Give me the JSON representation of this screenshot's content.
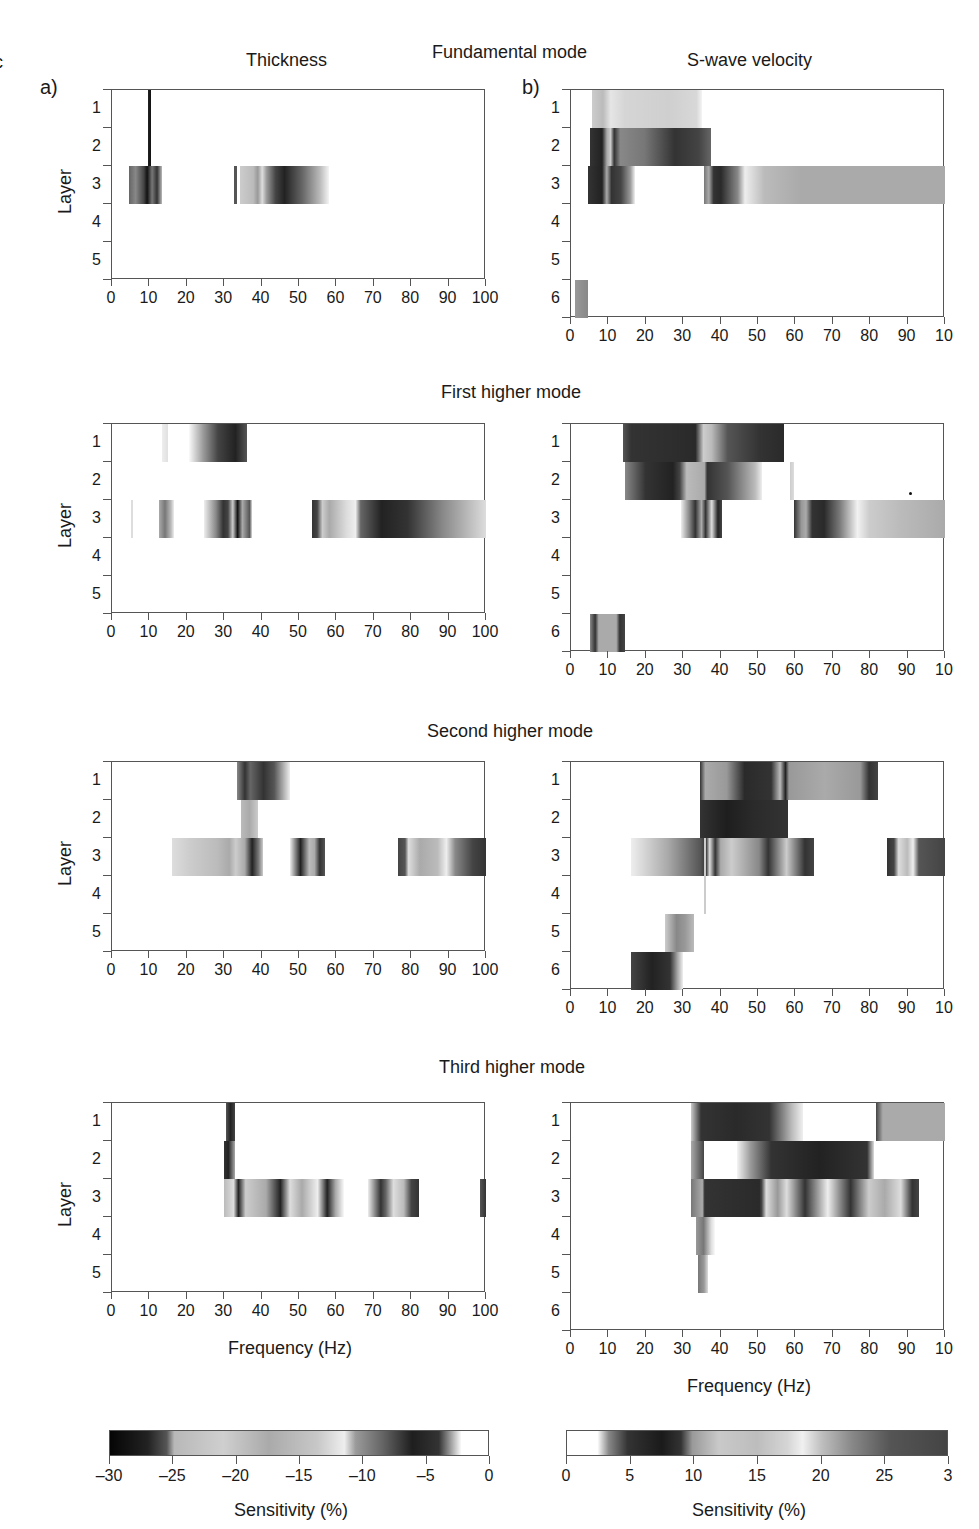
{
  "figure": {
    "edge_fragment": "c",
    "panel_labels": {
      "a": "a)",
      "b": "b)"
    },
    "column_titles": {
      "thickness": "Thickness",
      "vs": "S-wave velocity"
    },
    "y_axis_label": "Layer",
    "x_axis_label": "Frequency (Hz)",
    "colorbars": {
      "left": {
        "ticks": [
          "–30",
          "–25",
          "–20",
          "–15",
          "–10",
          "–5",
          "0"
        ],
        "title": "Sensitivity (%)",
        "gradient": "linear-gradient(to right,#050505 0%,#222 10%,#555 15%,#b8b8b8 17%,#cfcfcf 30%,#aaa 42%,#c8c8c8 55%,#eee 62%,#9a9a9a 65%,#666 72%,#1e1e1e 80%,#333 87%,#bbb 91%,#fff 93%,#fff 100%)"
      },
      "right": {
        "ticks": [
          "0",
          "5",
          "10",
          "15",
          "20",
          "25",
          "3"
        ],
        "title": "Sensitivity (%)",
        "gradient": "linear-gradient(to right,#fff 0%,#fff 8%,#888 11%,#333 16%,#1a1a1a 25%,#333 30%,#9a9a9a 33%,#c9c9c9 40%,#bdbdbd 50%,#d5d5d5 58%,#f0f0f0 62%,#bfbfbf 67%,#888 75%,#555 85%,#444 100%)"
      }
    }
  },
  "chart_data": [
    {
      "type": "heatmap",
      "title": "Fundamental mode",
      "panel": "Thickness",
      "xlabel": "",
      "ylabel": "Layer",
      "xlim": [
        0,
        100
      ],
      "layers": 5,
      "x_ticks": [
        "0",
        "10",
        "20",
        "30",
        "40",
        "50",
        "60",
        "70",
        "80",
        "90",
        "100"
      ],
      "y_ticks": [
        "1",
        "2",
        "3",
        "4",
        "5"
      ],
      "bands": [
        {
          "layer_from": 1,
          "layer_to": 3,
          "x0": 9.5,
          "x1": 10.5,
          "gradient": "linear-gradient(to right,#222,#111)"
        },
        {
          "layer_from": 3,
          "layer_to": 3,
          "x0": 4.5,
          "x1": 13.5,
          "gradient": "linear-gradient(to right,#666,#888 20%,#444 45%,#111 55%,#777 70%,#333 85%,#bbb)"
        },
        {
          "layer_from": 3,
          "layer_to": 3,
          "x0": 32.5,
          "x1": 33.3,
          "gradient": "linear-gradient(to right,#555,#555)"
        },
        {
          "layer_from": 3,
          "layer_to": 3,
          "x0": 34.2,
          "x1": 58,
          "gradient": "linear-gradient(to right,#ccc,#bbb 15%,#999 20%,#ddd 25%,#999 30%,#444 40%,#222 50%,#666 70%,#bbb 90%,#f4f4f4)"
        }
      ],
      "sensitivity_range": [
        -30,
        0
      ]
    },
    {
      "type": "heatmap",
      "title": "Fundamental mode",
      "panel": "S-wave velocity",
      "xlabel": "",
      "ylabel": "",
      "xlim": [
        0,
        100
      ],
      "layers": 6,
      "x_ticks": [
        "0",
        "10",
        "20",
        "30",
        "40",
        "50",
        "60",
        "70",
        "80",
        "90",
        "10"
      ],
      "y_ticks": [
        "1",
        "2",
        "3",
        "4",
        "5",
        "6"
      ],
      "bands": [
        {
          "layer_from": 1,
          "layer_to": 1,
          "x0": 5.5,
          "x1": 35,
          "gradient": "linear-gradient(to right,#ccc,#bbb 10%,#e5e5e5 17%,#d5d5d5 30%,#cfcfcf 70%,#d8d8d8 95%,#f4f4f4)"
        },
        {
          "layer_from": 2,
          "layer_to": 2,
          "x0": 5,
          "x1": 37.5,
          "gradient": "linear-gradient(to right,#333,#222 10%,#aaa 14%,#ccc 17%,#333 20%,#888 25%,#777 45%,#333 70%,#444 90%,#666)"
        },
        {
          "layer_from": 3,
          "layer_to": 3,
          "x0": 4.5,
          "x1": 17,
          "gradient": "linear-gradient(to right,#333,#222 30%,#aaa 40%,#333 50%,#444 70%,#999 90%,#f0f0f0)"
        },
        {
          "layer_from": 3,
          "layer_to": 3,
          "x0": 35.5,
          "x1": 100,
          "gradient": "linear-gradient(to right,#777 0%,#aaa 2%,#333 4%,#2a2a2a 7%,#888 14%,#eee 17%,#bbb 25%,#aaa 40%,#aaa 100%)"
        },
        {
          "layer_from": 6,
          "layer_to": 6,
          "x0": 1,
          "x1": 4.5,
          "gradient": "linear-gradient(to right,#999,#888)"
        }
      ],
      "sensitivity_range": [
        0,
        30
      ]
    },
    {
      "type": "heatmap",
      "title": "First higher mode",
      "panel": "Thickness",
      "xlabel": "",
      "ylabel": "Layer",
      "xlim": [
        0,
        100
      ],
      "layers": 5,
      "x_ticks": [
        "0",
        "10",
        "20",
        "30",
        "40",
        "50",
        "60",
        "70",
        "80",
        "90",
        "100"
      ],
      "y_ticks": [
        "1",
        "2",
        "3",
        "4",
        "5"
      ],
      "bands": [
        {
          "layer_from": 1,
          "layer_to": 1,
          "x0": 13.5,
          "x1": 15,
          "gradient": "linear-gradient(to right,#eee,#e0e0e0)"
        },
        {
          "layer_from": 1,
          "layer_to": 1,
          "x0": 20.5,
          "x1": 36,
          "gradient": "linear-gradient(to right,#fafafa,#999 25%,#444 50%,#222 80%,#555)"
        },
        {
          "layer_from": 3,
          "layer_to": 3,
          "x0": 5,
          "x1": 5.5,
          "gradient": "linear-gradient(to right,#ddd,#ddd)"
        },
        {
          "layer_from": 3,
          "layer_to": 3,
          "x0": 12.5,
          "x1": 16.5,
          "gradient": "linear-gradient(to right,#aaa,#777 40%,#bbb 80%,#eee)"
        },
        {
          "layer_from": 3,
          "layer_to": 3,
          "x0": 24.5,
          "x1": 37.5,
          "gradient": "linear-gradient(to right,#eee,#888 25%,#333 40%,#444 50%,#ccc 60%,#111 70%,#aaa 80%,#555 95%,#ddd)"
        },
        {
          "layer_from": 3,
          "layer_to": 3,
          "x0": 53.5,
          "x1": 100,
          "gradient": "linear-gradient(to right,#333 0%,#444 3%,#ccc 6%,#aaa 10%,#ddd 20%,#eee 25%,#666 28%,#222 40%,#333 55%,#888 75%,#ddd 100%)"
        }
      ],
      "sensitivity_range": [
        -30,
        0
      ]
    },
    {
      "type": "heatmap",
      "title": "First higher mode",
      "panel": "S-wave velocity",
      "xlabel": "",
      "ylabel": "",
      "xlim": [
        0,
        100
      ],
      "layers": 6,
      "x_ticks": [
        "0",
        "10",
        "20",
        "30",
        "40",
        "50",
        "60",
        "70",
        "80",
        "90",
        "10"
      ],
      "y_ticks": [
        "1",
        "2",
        "3",
        "4",
        "5",
        "6"
      ],
      "bands": [
        {
          "layer_from": 1,
          "layer_to": 1,
          "x0": 14,
          "x1": 57,
          "gradient": "linear-gradient(to right,#555 0%,#333 5%,#2a2a2a 45%,#ccc 50%,#bbb 55%,#555 65%,#333 85%,#2a2a2a 100%)"
        },
        {
          "layer_from": 2,
          "layer_to": 2,
          "x0": 14.5,
          "x1": 51,
          "gradient": "linear-gradient(to right,#888,#333 15%,#222 35%,#444 40%,#bbb 45%,#aaa 58%,#333 60%,#555 75%,#bbb 95%,#eee)"
        },
        {
          "layer_from": 2,
          "layer_to": 2,
          "x0": 58.5,
          "x1": 59.5,
          "gradient": "linear-gradient(to right,#ccc,#ddd)"
        },
        {
          "layer_from": 3,
          "layer_to": 3,
          "x0": 29.5,
          "x1": 40.5,
          "gradient": "linear-gradient(to right,#eee,#888 20%,#333 35%,#aaa 50%,#333 60%,#ddd 75%,#222 90%,#444)"
        },
        {
          "layer_from": 3,
          "layer_to": 3,
          "x0": 59.5,
          "x1": 100,
          "gradient": "linear-gradient(to right,#333 0%,#999 5%,#aaa 8%,#333 12%,#2a2a2a 20%,#777 30%,#f2f2f2 42%,#ccc 50%,#bbb 70%,#aaa 100%)"
        },
        {
          "layer_from": 6,
          "layer_to": 6,
          "x0": 5,
          "x1": 14.5,
          "gradient": "linear-gradient(to right,#888,#333 15%,#aaa 25%,#aaa 75%,#333 85%,#444)"
        }
      ],
      "annotations": [
        {
          "type": "dot",
          "x": 90.5,
          "layer": 2.8
        }
      ],
      "sensitivity_range": [
        0,
        30
      ]
    },
    {
      "type": "heatmap",
      "title": "Second higher mode",
      "panel": "Thickness",
      "xlabel": "",
      "ylabel": "Layer",
      "xlim": [
        0,
        100
      ],
      "layers": 5,
      "x_ticks": [
        "0",
        "10",
        "20",
        "30",
        "40",
        "50",
        "60",
        "70",
        "80",
        "90",
        "100"
      ],
      "y_ticks": [
        "1",
        "2",
        "3",
        "4",
        "5"
      ],
      "bands": [
        {
          "layer_from": 1,
          "layer_to": 1,
          "x0": 33.5,
          "x1": 47.5,
          "gradient": "linear-gradient(to right,#888,#333 15%,#666 25%,#333 50%,#555 70%,#bbb 90%,#eee)"
        },
        {
          "layer_from": 2,
          "layer_to": 2,
          "x0": 34.5,
          "x1": 39,
          "gradient": "linear-gradient(to right,#bbb,#aaa 50%,#ccc)"
        },
        {
          "layer_from": 3,
          "layer_to": 3,
          "x0": 16,
          "x1": 40.5,
          "gradient": "linear-gradient(to right,#ddd,#ccc 20%,#bbb 50%,#aaa 63%,#ccc 70%,#aaa 80%,#222 88%,#777 95%,#ccc)"
        },
        {
          "layer_from": 3,
          "layer_to": 3,
          "x0": 47.5,
          "x1": 57,
          "gradient": "linear-gradient(to right,#eee,#888 15%,#222 30%,#bbb 55%,#aaa 70%,#333 85%,#555)"
        },
        {
          "layer_from": 3,
          "layer_to": 3,
          "x0": 76.5,
          "x1": 100,
          "gradient": "linear-gradient(to right,#444 0%,#555 8%,#ddd 12%,#aaa 25%,#bbb 45%,#eee 55%,#888 65%,#444 85%,#333 100%)"
        }
      ],
      "sensitivity_range": [
        -30,
        0
      ]
    },
    {
      "type": "heatmap",
      "title": "Second higher mode",
      "panel": "S-wave velocity",
      "xlabel": "",
      "ylabel": "",
      "xlim": [
        0,
        100
      ],
      "layers": 6,
      "x_ticks": [
        "0",
        "10",
        "20",
        "30",
        "40",
        "50",
        "60",
        "70",
        "80",
        "90",
        "10"
      ],
      "y_ticks": [
        "1",
        "2",
        "3",
        "4",
        "5",
        "6"
      ],
      "bands": [
        {
          "layer_from": 1,
          "layer_to": 1,
          "x0": 34.5,
          "x1": 82,
          "gradient": "linear-gradient(to right,#333 0%,#aaa 3%,#999 15%,#2a2a2a 25%,#333 40%,#bbb 45%,#222 48%,#999 50%,#aaa 70%,#999 90%,#333 95%,#444 100%)"
        },
        {
          "layer_from": 2,
          "layer_to": 2,
          "x0": 34.5,
          "x1": 58,
          "gradient": "linear-gradient(to right,#333,#1e1e1e 30%,#2a2a2a 60%,#333)"
        },
        {
          "layer_from": 3,
          "layer_to": 3,
          "x0": 16,
          "x1": 65,
          "gradient": "linear-gradient(to right,#eee 0%,#aaa 20%,#555 38%,#333 41%,#ddd 43%,#333 46%,#aaa 49%,#ccc 55%,#888 70%,#333 75%,#ccc 85%,#333 95%,#444 100%)"
        },
        {
          "layer_from": 3,
          "layer_to": 4,
          "x0": 35.5,
          "x1": 36,
          "gradient": "linear-gradient(to right,#ccc,#ccc)"
        },
        {
          "layer_from": 3,
          "layer_to": 3,
          "x0": 84.5,
          "x1": 100,
          "gradient": "linear-gradient(to right,#333 0%,#444 12%,#ddd 20%,#bbb 35%,#eee 45%,#555 55%,#444 100%)"
        },
        {
          "layer_from": 5,
          "layer_to": 5,
          "x0": 25,
          "x1": 33,
          "gradient": "linear-gradient(to right,#ccc,#888 40%,#999 70%,#bbb)"
        },
        {
          "layer_from": 6,
          "layer_to": 6,
          "x0": 16,
          "x1": 30,
          "gradient": "linear-gradient(to right,#444,#222 40%,#333 75%,#aaa 90%,#f0f0f0)"
        }
      ],
      "sensitivity_range": [
        0,
        30
      ]
    },
    {
      "type": "heatmap",
      "title": "Third higher mode",
      "panel": "Thickness",
      "xlabel": "Frequency (Hz)",
      "ylabel": "Layer",
      "xlim": [
        0,
        100
      ],
      "layers": 5,
      "x_ticks": [
        "0",
        "10",
        "20",
        "30",
        "40",
        "50",
        "60",
        "70",
        "80",
        "90",
        "100"
      ],
      "y_ticks": [
        "1",
        "2",
        "3",
        "4",
        "5"
      ],
      "bands": [
        {
          "layer_from": 1,
          "layer_to": 1,
          "x0": 30.5,
          "x1": 33,
          "gradient": "linear-gradient(to right,#555,#222 50%,#444)"
        },
        {
          "layer_from": 2,
          "layer_to": 2,
          "x0": 30,
          "x1": 33,
          "gradient": "linear-gradient(to right,#333,#222 40%,#aaa)"
        },
        {
          "layer_from": 3,
          "layer_to": 3,
          "x0": 30,
          "x1": 62,
          "gradient": "linear-gradient(to right,#bbb 0%,#ddd 8%,#222 12%,#ccc 18%,#aaa 35%,#222 47%,#ddd 55%,#aaa 65%,#eee 78%,#222 86%,#aaa 93%,#fafafa 100%)"
        },
        {
          "layer_from": 3,
          "layer_to": 3,
          "x0": 68.5,
          "x1": 82,
          "gradient": "linear-gradient(to right,#eee,#333 25%,#666 35%,#ddd 50%,#bbb 70%,#444 85%,#333)"
        },
        {
          "layer_from": 3,
          "layer_to": 3,
          "x0": 98.5,
          "x1": 100,
          "gradient": "linear-gradient(to right,#555,#333)"
        }
      ],
      "sensitivity_range": [
        -30,
        0
      ]
    },
    {
      "type": "heatmap",
      "title": "Third higher mode",
      "panel": "S-wave velocity",
      "xlabel": "Frequency (Hz)",
      "ylabel": "",
      "xlim": [
        0,
        100
      ],
      "layers": 6,
      "x_ticks": [
        "0",
        "10",
        "20",
        "30",
        "40",
        "50",
        "60",
        "70",
        "80",
        "90",
        "10"
      ],
      "y_ticks": [
        "1",
        "2",
        "3",
        "4",
        "5",
        "6"
      ],
      "bands": [
        {
          "layer_from": 1,
          "layer_to": 1,
          "x0": 32,
          "x1": 62,
          "gradient": "linear-gradient(to right,#ccc 0%,#333 9%,#2a2a2a 40%,#333 70%,#bbb 90%,#f0f0f0 100%)"
        },
        {
          "layer_from": 1,
          "layer_to": 1,
          "x0": 81.5,
          "x1": 100,
          "gradient": "linear-gradient(to right,#444,#aaa 10%,#aaa 100%)"
        },
        {
          "layer_from": 2,
          "layer_to": 2,
          "x0": 32,
          "x1": 35.5,
          "gradient": "linear-gradient(to right,#aaa,#444)"
        },
        {
          "layer_from": 2,
          "layer_to": 2,
          "x0": 44.5,
          "x1": 81,
          "gradient": "linear-gradient(to right,#f4f4f4 0%,#999 10%,#333 25%,#222 60%,#333 95%,#ddd 100%)"
        },
        {
          "layer_from": 3,
          "layer_to": 3,
          "x0": 32,
          "x1": 93,
          "gradient": "linear-gradient(to right,#777 0%,#aaa 5%,#333 6%,#2a2a2a 30%,#444 31%,#ddd 33%,#999 38%,#ddd 42%,#333 50%,#eee 60%,#333 70%,#ccc 78%,#aaa 85%,#ddd 92%,#333 97%,#444 100%)"
        },
        {
          "layer_from": 4,
          "layer_to": 4,
          "x0": 33.5,
          "x1": 38.5,
          "gradient": "linear-gradient(to right,#999,#777 40%,#ddd 80%,#fafafa)"
        },
        {
          "layer_from": 5,
          "layer_to": 5,
          "x0": 34,
          "x1": 36.5,
          "gradient": "linear-gradient(to right,#777,#999 60%,#ddd)"
        }
      ],
      "sensitivity_range": [
        0,
        30
      ]
    }
  ]
}
